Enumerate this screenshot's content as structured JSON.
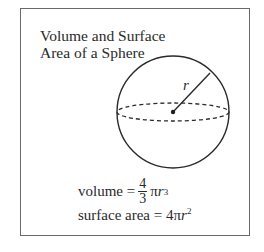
{
  "title": {
    "line1": "Volume and Surface",
    "line2": "Area of a Sphere"
  },
  "diagram": {
    "radius_label": "r"
  },
  "formulas": {
    "volume": {
      "label": "volume =",
      "numerator": "4",
      "denominator": "3",
      "pi": "π",
      "var": "r",
      "exponent": "3"
    },
    "surface_area": {
      "label": "surface area = 4π",
      "var": "r",
      "exponent": "2"
    }
  }
}
